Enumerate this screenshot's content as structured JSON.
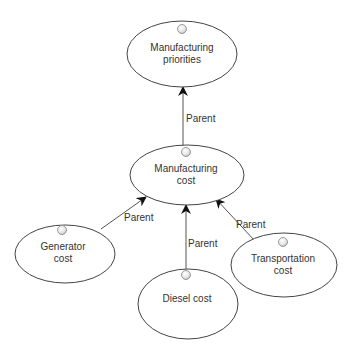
{
  "diagram": {
    "colors": {
      "node_stroke": "#444444",
      "node_fill": "#ffffff",
      "edge_stroke": "#555555",
      "text": "#333333",
      "icon_stroke": "#888888"
    },
    "nodes": [
      {
        "id": "manufacturing_priorities",
        "label_line1": "Manufacturing",
        "label_line2": "priorities"
      },
      {
        "id": "manufacturing_cost",
        "label_line1": "Manufacturing",
        "label_line2": "cost"
      },
      {
        "id": "generator_cost",
        "label_line1": "Generator",
        "label_line2": "cost"
      },
      {
        "id": "diesel_cost",
        "label_line1": "Diesel cost",
        "label_line2": ""
      },
      {
        "id": "transportation_cost",
        "label_line1": "Transportation",
        "label_line2": "cost"
      }
    ],
    "edges": [
      {
        "from": "manufacturing_cost",
        "to": "manufacturing_priorities",
        "label": "Parent"
      },
      {
        "from": "generator_cost",
        "to": "manufacturing_cost",
        "label": "Parent"
      },
      {
        "from": "diesel_cost",
        "to": "manufacturing_cost",
        "label": "Parent"
      },
      {
        "from": "transportation_cost",
        "to": "manufacturing_cost",
        "label": "Parent"
      }
    ]
  }
}
